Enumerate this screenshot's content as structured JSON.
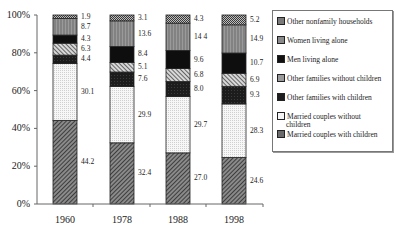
{
  "chart_data": {
    "type": "bar",
    "stacked": true,
    "percent": true,
    "title": "",
    "xlabel": "",
    "ylabel": "",
    "ylim": [
      0,
      100
    ],
    "yticks": [
      "0%",
      "20%",
      "40%",
      "60%",
      "80%",
      "100%"
    ],
    "categories": [
      "1960",
      "1978",
      "1988",
      "1998"
    ],
    "grid": false,
    "legend_position": "right",
    "series": [
      {
        "name": "Married couples with children",
        "values": [
          44.2,
          32.4,
          27.0,
          24.6
        ],
        "labels": [
          "44.2",
          "32.4",
          "27.0",
          "24.6"
        ],
        "fill": "#6a6a6a",
        "pattern": "diag-dense"
      },
      {
        "name": "Married couples without children",
        "values": [
          30.1,
          29.9,
          29.7,
          28.3
        ],
        "labels": [
          "30.1",
          "29.9",
          "29.7",
          "28.3"
        ],
        "fill": "#f2f2f2",
        "pattern": "dots"
      },
      {
        "name": "Other families with children",
        "values": [
          4.4,
          7.6,
          8.0,
          9.3
        ],
        "labels": [
          "4.4",
          "7.6",
          "8.0",
          "9.3"
        ],
        "fill": "#1e1e1e",
        "pattern": "solid-dark"
      },
      {
        "name": "Other families without children",
        "values": [
          6.3,
          5.1,
          6.8,
          6.9
        ],
        "labels": [
          "6.3",
          "5.1",
          "6.8",
          "6.9"
        ],
        "fill": "#9a9a9a",
        "pattern": "diag-wide"
      },
      {
        "name": "Men living alone",
        "values": [
          4.3,
          8.4,
          9.6,
          10.7
        ],
        "labels": [
          "4.3",
          "8.4",
          "9.6",
          "10.7"
        ],
        "fill": "#111111",
        "pattern": "solid"
      },
      {
        "name": "Women living alone",
        "values": [
          8.7,
          13.6,
          14.4,
          14.9
        ],
        "labels": [
          "8.7",
          "13.6",
          "14 4",
          "14.9"
        ],
        "fill": "#8a8a8a",
        "pattern": "vertical"
      },
      {
        "name": "Other nonfamily households",
        "values": [
          1.9,
          3.1,
          4.3,
          5.2
        ],
        "labels": [
          "1.9",
          "3.1",
          "4.3",
          "5.2"
        ],
        "fill": "#7a7a7a",
        "pattern": "checker"
      }
    ]
  },
  "legend": {
    "items": [
      "Other nonfamily households",
      "Women living alone",
      "Men living alone",
      "Other families without children",
      "Other families with children",
      "Married couples without",
      "children",
      "Married couples with children"
    ]
  }
}
